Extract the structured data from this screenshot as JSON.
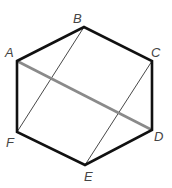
{
  "diagram": {
    "type": "hexagon-with-diagonals",
    "vertices": [
      {
        "id": "A",
        "label": "A",
        "x": 17,
        "y": 61,
        "lx": 5,
        "ly": 57
      },
      {
        "id": "B",
        "label": "B",
        "x": 84,
        "y": 27,
        "lx": 73,
        "ly": 23
      },
      {
        "id": "C",
        "label": "C",
        "x": 152,
        "y": 61,
        "lx": 151,
        "ly": 57
      },
      {
        "id": "D",
        "label": "D",
        "x": 152,
        "y": 130,
        "lx": 154,
        "ly": 141
      },
      {
        "id": "E",
        "label": "E",
        "x": 85,
        "y": 165,
        "lx": 84,
        "ly": 181
      },
      {
        "id": "F",
        "label": "F",
        "x": 17,
        "y": 132,
        "lx": 6,
        "ly": 147
      }
    ],
    "segments": [
      {
        "from": "A",
        "to": "D",
        "style": "thick-gray",
        "color": "#8a8a8a"
      },
      {
        "from": "B",
        "to": "F",
        "style": "thin",
        "color": "#333333"
      },
      {
        "from": "C",
        "to": "E",
        "style": "thin",
        "color": "#333333"
      }
    ],
    "outline_color": "#111111"
  }
}
